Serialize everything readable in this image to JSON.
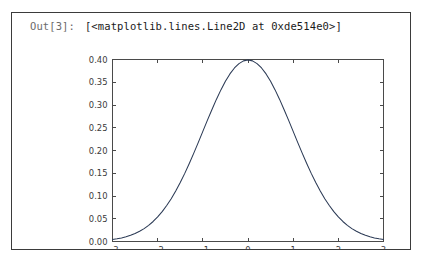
{
  "cell": {
    "prompt": "Out[3]:",
    "repr_text": "[<matplotlib.lines.Line2D at 0xde514e0>]",
    "border_color": "#3b3b3b",
    "background": "#ffffff"
  },
  "chart_data": {
    "type": "line",
    "title": "",
    "xlabel": "",
    "ylabel": "",
    "xlim": [
      -3,
      3
    ],
    "ylim": [
      0.0,
      0.4
    ],
    "grid": false,
    "legend": null,
    "line_color": "#2b3a55",
    "axis_color": "#4a4a4a",
    "xticks": [
      -3,
      -2,
      -1,
      0,
      1,
      2,
      3
    ],
    "xticklabels": [
      "−3",
      "−2",
      "−1",
      "0",
      "1",
      "2",
      "3"
    ],
    "yticks": [
      0.0,
      0.05,
      0.1,
      0.15,
      0.2,
      0.25,
      0.3,
      0.35,
      0.4
    ],
    "yticklabels": [
      "0.00",
      "0.05",
      "0.10",
      "0.15",
      "0.20",
      "0.25",
      "0.30",
      "0.35",
      "0.40"
    ],
    "series": [
      {
        "name": "normal-pdf",
        "x": [
          -3.0,
          -2.9,
          -2.8,
          -2.7,
          -2.6,
          -2.5,
          -2.4,
          -2.3,
          -2.2,
          -2.1,
          -2.0,
          -1.9,
          -1.8,
          -1.7,
          -1.6,
          -1.5,
          -1.4,
          -1.3,
          -1.2,
          -1.1,
          -1.0,
          -0.9,
          -0.8,
          -0.7,
          -0.6,
          -0.5,
          -0.4,
          -0.3,
          -0.2,
          -0.1,
          0.0,
          0.1,
          0.2,
          0.3,
          0.4,
          0.5,
          0.6,
          0.7,
          0.8,
          0.9,
          1.0,
          1.1,
          1.2,
          1.3,
          1.4,
          1.5,
          1.6,
          1.7,
          1.8,
          1.9,
          2.0,
          2.1,
          2.2,
          2.3,
          2.4,
          2.5,
          2.6,
          2.7,
          2.8,
          2.9,
          3.0
        ],
        "y": [
          0.0044,
          0.006,
          0.0079,
          0.0104,
          0.0136,
          0.0175,
          0.0224,
          0.0283,
          0.0355,
          0.044,
          0.054,
          0.0656,
          0.079,
          0.094,
          0.1109,
          0.1295,
          0.1497,
          0.1714,
          0.1942,
          0.2179,
          0.242,
          0.2661,
          0.2897,
          0.3123,
          0.3332,
          0.3521,
          0.3683,
          0.3814,
          0.391,
          0.397,
          0.3989,
          0.397,
          0.391,
          0.3814,
          0.3683,
          0.3521,
          0.3332,
          0.3123,
          0.2897,
          0.2661,
          0.242,
          0.2179,
          0.1942,
          0.1714,
          0.1497,
          0.1295,
          0.1109,
          0.094,
          0.079,
          0.0656,
          0.054,
          0.044,
          0.0355,
          0.0283,
          0.0224,
          0.0175,
          0.0136,
          0.0104,
          0.0079,
          0.006,
          0.0044
        ]
      }
    ]
  }
}
